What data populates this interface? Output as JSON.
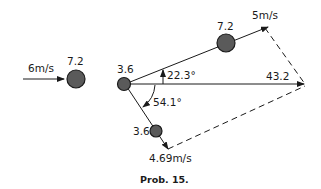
{
  "diagram": {
    "incoming": {
      "velocity_label": "6m/s",
      "mass_label": "7.2"
    },
    "center": {
      "mass_label": "3.6"
    },
    "upper_particle": {
      "mass_label": "7.2",
      "velocity_label": "5m/s",
      "angle_label": "22.3°"
    },
    "lower_particle": {
      "mass_label": "3.6",
      "velocity_label": "4.69m/s",
      "angle_label": "54.1°"
    },
    "resultant_label": "43.2",
    "caption": "Prob. 15."
  }
}
